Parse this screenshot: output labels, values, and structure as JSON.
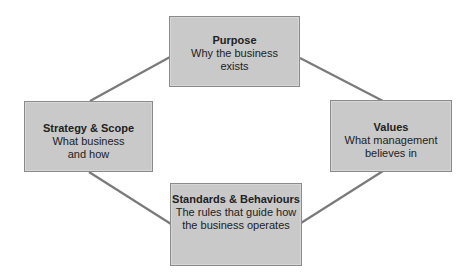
{
  "diagram": {
    "type": "cycle",
    "colors": {
      "box_fill": "#c9c9c9",
      "box_border": "#8a8a8a",
      "connector": "#7a7a7a",
      "text": "#222222"
    },
    "nodes": {
      "purpose": {
        "title": "Purpose",
        "lines": [
          "Why the business",
          "exists"
        ]
      },
      "strategy": {
        "title": "Strategy & Scope",
        "lines": [
          "What business",
          "and how"
        ]
      },
      "values": {
        "title": "Values",
        "lines": [
          "What management",
          "believes in"
        ]
      },
      "standards": {
        "title": "Standards & Behaviours",
        "lines": [
          "The rules that guide how",
          "the business operates"
        ]
      }
    },
    "edges": [
      {
        "from": "strategy",
        "to": "purpose"
      },
      {
        "from": "purpose",
        "to": "values"
      },
      {
        "from": "strategy",
        "to": "standards"
      },
      {
        "from": "values",
        "to": "standards"
      }
    ]
  }
}
